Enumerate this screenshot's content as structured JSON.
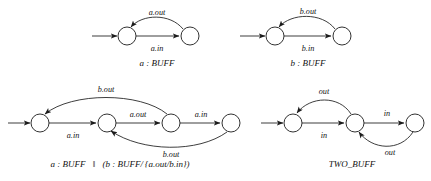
{
  "figure": {
    "background_color": "#ffffff",
    "stroke_color": "#1b1b1b",
    "text_color": "#111111"
  },
  "diagrams": [
    {
      "id": "a-buff",
      "name": "a : BUFF",
      "caption": "a : BUFF",
      "caption_parts": {
        "prefix": "a",
        "colon": " : ",
        "process": "BUFF"
      },
      "states": 2,
      "has_initial_arrow": true,
      "transitions": [
        {
          "from": 1,
          "to": 2,
          "label": "a.in",
          "shape": "straight",
          "position": "below"
        },
        {
          "from": 2,
          "to": 1,
          "label": "a.out",
          "shape": "arc",
          "position": "above"
        }
      ]
    },
    {
      "id": "b-buff",
      "name": "b : BUFF",
      "caption": "b : BUFF",
      "caption_parts": {
        "prefix": "b",
        "colon": " : ",
        "process": "BUFF"
      },
      "states": 2,
      "has_initial_arrow": true,
      "transitions": [
        {
          "from": 1,
          "to": 2,
          "label": "b.in",
          "shape": "straight",
          "position": "below"
        },
        {
          "from": 2,
          "to": 1,
          "label": "b.out",
          "shape": "arc",
          "position": "above"
        }
      ]
    },
    {
      "id": "a-buff-par-b-buff-renamed",
      "name": "a : BUFF || (b : BUFF/{a.out/b.in})",
      "caption": "a : BUFF ‖ (b : BUFF/{a.out/b.in})",
      "caption_parts": {
        "left": "a : BUFF",
        "par": "‖",
        "open": "(",
        "right": "b : BUFF/",
        "renaming": "{a.out/b.in}",
        "close": ")"
      },
      "states": 4,
      "has_initial_arrow": true,
      "transitions": [
        {
          "from": 1,
          "to": 2,
          "label": "a.in",
          "shape": "straight",
          "position": "below"
        },
        {
          "from": 2,
          "to": 3,
          "label": "a.out",
          "shape": "straight",
          "position": "above"
        },
        {
          "from": 3,
          "to": 4,
          "label": "a.in",
          "shape": "straight",
          "position": "above"
        },
        {
          "from": 3,
          "to": 1,
          "label": "b.out",
          "shape": "arc",
          "position": "above"
        },
        {
          "from": 4,
          "to": 2,
          "label": "b.out",
          "shape": "arc",
          "position": "below"
        }
      ]
    },
    {
      "id": "two-buff",
      "name": "TWO_BUFF",
      "caption": "TWO_BUFF",
      "caption_parts": {
        "process": "TWO_BUFF"
      },
      "states": 3,
      "has_initial_arrow": true,
      "transitions": [
        {
          "from": 1,
          "to": 2,
          "label": "in",
          "shape": "straight",
          "position": "below"
        },
        {
          "from": 2,
          "to": 3,
          "label": "in",
          "shape": "straight",
          "position": "above"
        },
        {
          "from": 2,
          "to": 1,
          "label": "out",
          "shape": "arc",
          "position": "above"
        },
        {
          "from": 3,
          "to": 2,
          "label": "out",
          "shape": "arc",
          "position": "below"
        }
      ]
    }
  ],
  "labels": {
    "a_out": "a.out",
    "a_in": "a.in",
    "b_out": "b.out",
    "b_in": "b.in",
    "out": "out",
    "in": "in"
  },
  "captions": {
    "d1": "a : BUFF",
    "d2": "b : BUFF",
    "d3_left": "a : BUFF",
    "d3_par": "‖",
    "d3_right": "(b : BUFF/ {a.out/b.in})",
    "d4": "TWO_BUFF"
  }
}
